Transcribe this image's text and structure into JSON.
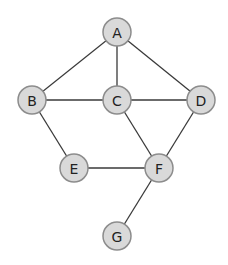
{
  "diagram": {
    "type": "undirected-graph",
    "colors": {
      "node_fill": "#d9d9d9",
      "node_stroke": "#8c8c8c",
      "edge": "#3a3a3a",
      "label": "#222222",
      "background": "#ffffff"
    },
    "nodes": [
      {
        "id": "A",
        "label": "A",
        "x": 117,
        "y": 32
      },
      {
        "id": "B",
        "label": "B",
        "x": 32,
        "y": 100
      },
      {
        "id": "C",
        "label": "C",
        "x": 117,
        "y": 100
      },
      {
        "id": "D",
        "label": "D",
        "x": 201,
        "y": 100
      },
      {
        "id": "E",
        "label": "E",
        "x": 74,
        "y": 168
      },
      {
        "id": "F",
        "label": "F",
        "x": 159,
        "y": 168
      },
      {
        "id": "G",
        "label": "G",
        "x": 117,
        "y": 236
      }
    ],
    "edges": [
      {
        "from": "A",
        "to": "B"
      },
      {
        "from": "A",
        "to": "C"
      },
      {
        "from": "A",
        "to": "D"
      },
      {
        "from": "B",
        "to": "C"
      },
      {
        "from": "C",
        "to": "D"
      },
      {
        "from": "B",
        "to": "E"
      },
      {
        "from": "C",
        "to": "F"
      },
      {
        "from": "D",
        "to": "F"
      },
      {
        "from": "E",
        "to": "F"
      },
      {
        "from": "F",
        "to": "G"
      }
    ],
    "node_radius": 14
  }
}
